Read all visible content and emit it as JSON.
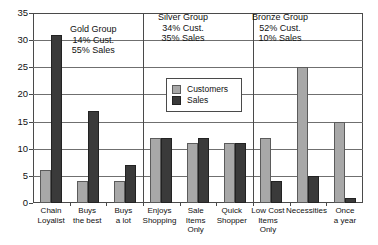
{
  "chart_data": {
    "type": "bar",
    "title": "",
    "xlabel": "",
    "ylabel": "",
    "ylim": [
      0,
      35
    ],
    "yticks": [
      0,
      5,
      10,
      15,
      20,
      25,
      30,
      35
    ],
    "grid": true,
    "legend_position": "inside-upper-center",
    "categories": [
      "Chain Loyalist",
      "Buys the best",
      "Buys a lot",
      "Enjoys Shopping",
      "Sale Items Only",
      "Quick Shopper",
      "Low Cost Items Only",
      "Necessities",
      "Once a year"
    ],
    "category_lines": [
      [
        "Chain",
        "Loyalist"
      ],
      [
        "Buys",
        "the best"
      ],
      [
        "Buys",
        "a lot"
      ],
      [
        "Enjoys",
        "Shopping"
      ],
      [
        "Sale",
        "Items Only"
      ],
      [
        "Quick",
        "Shopper"
      ],
      [
        "Low Cost",
        "Items Only"
      ],
      [
        "Necessities",
        ""
      ],
      [
        "Once",
        "a year"
      ]
    ],
    "series": [
      {
        "name": "Customers",
        "color": "#a8a8a8",
        "values": [
          6,
          4,
          4,
          12,
          11,
          11,
          12,
          25,
          15
        ]
      },
      {
        "name": "Sales",
        "color": "#3a3a3a",
        "values": [
          31,
          17,
          7,
          12,
          12,
          11,
          4,
          5,
          1
        ]
      }
    ],
    "annotations": [
      {
        "name": "Gold Group",
        "lines": [
          "Gold Group",
          "14% Cust.",
          "55% Sales"
        ]
      },
      {
        "name": "Silver Group",
        "lines": [
          "Silver Group",
          "34% Cust.",
          "35% Sales"
        ]
      },
      {
        "name": "Bronze Group",
        "lines": [
          "Bronze Group",
          "52% Cust.",
          "10% Sales"
        ]
      }
    ]
  },
  "legend": {
    "customers_label": "Customers",
    "sales_label": "Sales"
  },
  "colors": {
    "customers": "#a8a8a8",
    "sales": "#3a3a3a",
    "axis": "#4a4a4a",
    "grid": "#6f6f6f"
  }
}
